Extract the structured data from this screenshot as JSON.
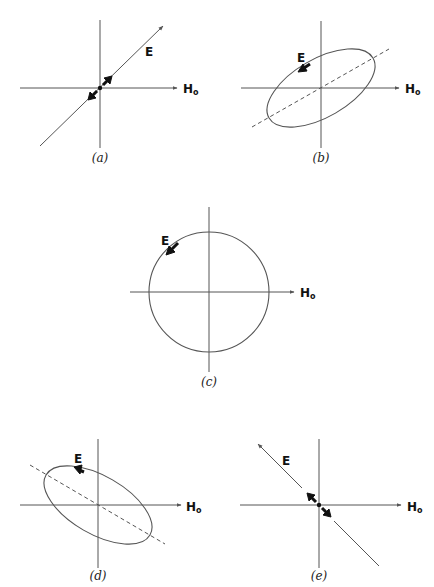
{
  "figure": {
    "axis_label_h": "H",
    "axis_label_h_subscript": "o",
    "field_label": "E",
    "panels": [
      {
        "id": "a",
        "caption": "(a)",
        "polarization": "linear",
        "orientation": "positive-slope"
      },
      {
        "id": "b",
        "caption": "(b)",
        "polarization": "elliptical",
        "orientation": "positive-slope",
        "rotation": "counterclockwise"
      },
      {
        "id": "c",
        "caption": "(c)",
        "polarization": "circular",
        "rotation": "counterclockwise"
      },
      {
        "id": "d",
        "caption": "(d)",
        "polarization": "elliptical",
        "orientation": "negative-slope",
        "rotation": "counterclockwise"
      },
      {
        "id": "e",
        "caption": "(e)",
        "polarization": "linear",
        "orientation": "negative-slope"
      }
    ]
  },
  "colors": {
    "line": "#555555",
    "text": "#111111",
    "background": "#ffffff"
  }
}
